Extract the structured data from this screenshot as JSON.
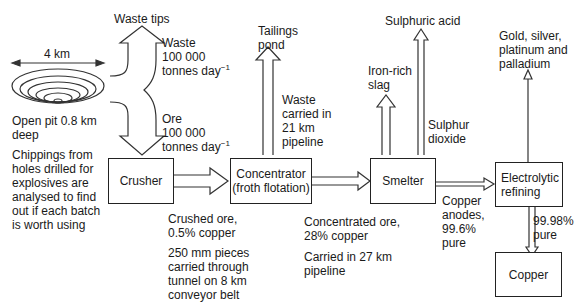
{
  "pit": {
    "width_label": "4 km",
    "depth_label_1": "Open pit 0.8 km",
    "depth_label_2": "deep",
    "note": [
      "Chippings from",
      "holes drilled for",
      "explosives are",
      "analysed to find",
      "out if each batch",
      "is worth using"
    ]
  },
  "waste_tips": {
    "title": "Waste tips",
    "label_1": "Waste",
    "label_2": "100 000",
    "label_3": "tonnes day",
    "label_exp": "−1"
  },
  "ore": {
    "label_1": "Ore",
    "label_2": "100 000",
    "label_3": "tonnes day",
    "label_exp": "−1"
  },
  "boxes": {
    "crusher": "Crusher",
    "concentrator_1": "Concentrator",
    "concentrator_2": "(froth flotation)",
    "smelter": "Smelter",
    "electrolytic_1": "Electrolytic",
    "electrolytic_2": "refining",
    "copper": "Copper"
  },
  "crushed_ore": {
    "line_1": "Crushed ore,",
    "line_2": "0.5% copper",
    "transport": [
      "250 mm pieces",
      "carried through",
      "tunnel on 8 km",
      "conveyor belt"
    ]
  },
  "tailings": {
    "title_1": "Tailings",
    "title_2": "pond",
    "note": [
      "Waste",
      "carried in",
      "21 km",
      "pipeline"
    ]
  },
  "concentrated_ore": {
    "line_1": "Concentrated ore,",
    "line_2": "28% copper",
    "transport_1": "Carried in 27 km",
    "transport_2": "pipeline"
  },
  "smelter_outputs": {
    "slag_1": "Iron-rich",
    "slag_2": "slag",
    "acid": "Sulphuric acid",
    "so2_1": "Sulphur",
    "so2_2": "dioxide"
  },
  "anodes": {
    "line_1": "Copper",
    "line_2": "anodes,",
    "line_3": "99.6%",
    "line_4": "pure"
  },
  "precious": {
    "line_1": "Gold, silver,",
    "line_2": "platinum and",
    "line_3": "palladium"
  },
  "refined": {
    "line_1": "99.98%",
    "line_2": "pure"
  }
}
